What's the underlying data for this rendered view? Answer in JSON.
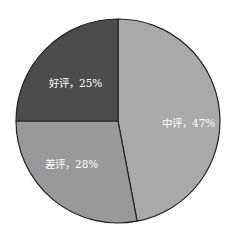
{
  "chart_data": {
    "type": "pie",
    "title": "",
    "start_angle": "12 o'clock",
    "direction": "clockwise",
    "slices": [
      {
        "label": "中评",
        "value": 47,
        "display": "中评，47%",
        "color": "#a9a9a9"
      },
      {
        "label": "差评",
        "value": 28,
        "display": "差评，28%",
        "color": "#999999"
      },
      {
        "label": "好评",
        "value": 25,
        "display": "好评，25%",
        "color": "#4c4c4c"
      }
    ],
    "categories": [
      "中评",
      "差评",
      "好评"
    ],
    "values": [
      47,
      28,
      25
    ],
    "unit": "%",
    "legend": "none (labels inside slices)",
    "edge_color": "#222222"
  }
}
